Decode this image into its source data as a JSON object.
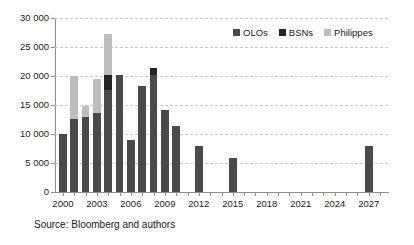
{
  "chart_data": {
    "type": "bar",
    "subtype": "stacked-bar",
    "title": "",
    "xlabel": "",
    "ylabel": "",
    "ylim": [
      0,
      30000
    ],
    "ytick_values": [
      0,
      5000,
      10000,
      15000,
      20000,
      25000,
      30000
    ],
    "ytick_labels": [
      "0",
      "5 000",
      "10 000",
      "15 000",
      "20 000",
      "25 000",
      "30 000"
    ],
    "xlim": [
      1999.3,
      2028.7
    ],
    "xtick_values": [
      2000,
      2003,
      2006,
      2009,
      2012,
      2015,
      2018,
      2021,
      2024,
      2027
    ],
    "xtick_labels": [
      "2000",
      "2003",
      "2006",
      "2009",
      "2012",
      "2015",
      "2018",
      "2021",
      "2024",
      "2027"
    ],
    "grid": "horizontal-dashed",
    "legend_position": "top-right-inside",
    "categories": [
      2000,
      2001,
      2002,
      2003,
      2004,
      2005,
      2006,
      2007,
      2008,
      2009,
      2010,
      2011,
      2012,
      2015,
      2027
    ],
    "series": [
      {
        "name": "OLOs",
        "color": "#4a4a4a",
        "values": [
          9950,
          12650,
          13000,
          13650,
          17600,
          20200,
          9050,
          18350,
          20200,
          14150,
          11400,
          0,
          7850,
          5950,
          7900
        ]
      },
      {
        "name": "BSNs",
        "color": "#252525",
        "values": [
          0,
          0,
          0,
          0,
          2600,
          0,
          0,
          0,
          1200,
          0,
          0,
          0,
          0,
          0,
          0
        ]
      },
      {
        "name": "Philippes",
        "color": "#bdbdbd",
        "values": [
          0,
          7400,
          1900,
          5900,
          7100,
          0,
          0,
          0,
          0,
          0,
          0,
          0,
          0,
          0,
          0
        ]
      }
    ],
    "totals": [
      9950,
      20050,
      14900,
      19550,
      27300,
      20200,
      9050,
      18350,
      21400,
      14150,
      11400,
      0,
      7850,
      5950,
      7900
    ],
    "source_note": "Source: Bloomberg and authors"
  },
  "legend": {
    "items": [
      {
        "label": "OLOs",
        "color": "#4a4a4a"
      },
      {
        "label": "BSNs",
        "color": "#252525"
      },
      {
        "label": "Philippes",
        "color": "#bdbdbd"
      }
    ]
  },
  "axis": {
    "y_labels": [
      "30 000",
      "25 000",
      "20 000",
      "15 000",
      "10 000",
      "5 000",
      "0"
    ],
    "x_labels": [
      "2000",
      "2003",
      "2006",
      "2009",
      "2012",
      "2015",
      "2018",
      "2021",
      "2024",
      "2027"
    ]
  },
  "footer": {
    "source": "Source: Bloomberg and authors"
  },
  "colors": {
    "olos": "#4a4a4a",
    "bsns": "#252525",
    "philippes": "#bdbdbd",
    "axis": "#8d8d8d",
    "grid": "#c9c9c9",
    "background": "#ffffff"
  }
}
